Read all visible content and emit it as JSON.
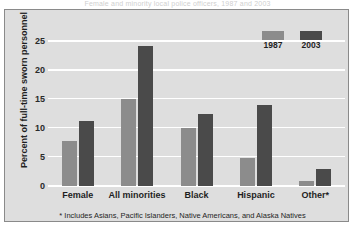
{
  "figure": {
    "cut_off_title": "Female and minority local police officers, 1987 and 2003",
    "footnote": "* Includes Asians, Pacific Islanders, Native Americans, and Alaska Natives"
  },
  "colors": {
    "background": "#dedede",
    "frame": "#8a8a8a",
    "gridline": "#ffffff",
    "series_1987": "#8c8c8c",
    "series_2003": "#4a4a4a",
    "text": "#1f1f1f"
  },
  "chart_data": {
    "type": "bar",
    "title": "",
    "xlabel": "",
    "ylabel": "Percent of full-time sworn personnel",
    "categories": [
      "Female",
      "All minorities",
      "Black",
      "Hispanic",
      "Other*"
    ],
    "series": [
      {
        "name": "1987",
        "color": "#8c8c8c",
        "values": [
          7.8,
          15.0,
          10.0,
          4.8,
          0.8
        ]
      },
      {
        "name": "2003",
        "color": "#4a4a4a",
        "values": [
          11.3,
          24.3,
          12.5,
          14.1,
          3.0
        ]
      }
    ],
    "ylim": [
      0,
      26.5
    ],
    "yticks": [
      0,
      5,
      10,
      15,
      20,
      25
    ],
    "ytick_labels": [
      "0",
      "5",
      "10",
      "15",
      "20",
      "25"
    ],
    "grid": true,
    "grid_axis": "y",
    "legend_position": "top-right",
    "annotations": [
      "* Includes Asians, Pacific Islanders, Native Americans, and Alaska Natives"
    ]
  }
}
